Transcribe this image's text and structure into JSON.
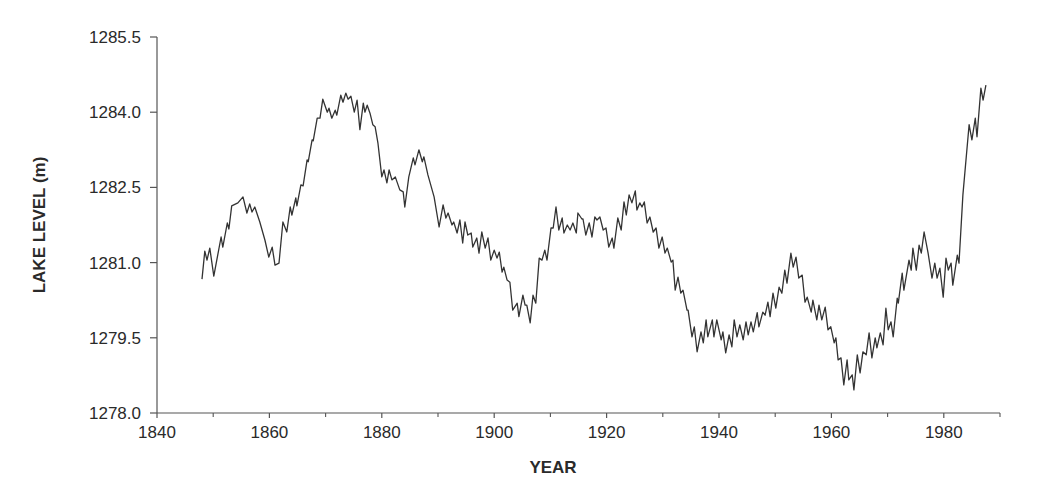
{
  "chart_data": {
    "type": "line",
    "title": "",
    "xlabel": "YEAR",
    "ylabel": "LAKE LEVEL (m)",
    "xlim": [
      1840,
      1990
    ],
    "ylim": [
      1278.0,
      1285.5
    ],
    "x_ticks": [
      1840,
      1860,
      1880,
      1900,
      1920,
      1940,
      1960,
      1980
    ],
    "x_tick_labels": [
      "1840",
      "1860",
      "1880",
      "1900",
      "1920",
      "1940",
      "1960",
      "1980"
    ],
    "x_minor_ticks": [
      1850,
      1870,
      1890,
      1910,
      1930,
      1950,
      1970,
      1990
    ],
    "y_ticks": [
      1278.0,
      1279.5,
      1281.0,
      1282.5,
      1284.0,
      1285.5
    ],
    "y_tick_labels": [
      "1278.0",
      "1279.5",
      "1281.0",
      "1282.5",
      "1284.0",
      "1285.5"
    ],
    "grid": false,
    "legend": null,
    "line_color": "#333333",
    "series": [
      {
        "name": "Lake level",
        "points": [
          [
            1848.0,
            1280.67
          ],
          [
            1848.5,
            1281.23
          ],
          [
            1848.9,
            1281.05
          ],
          [
            1849.4,
            1281.29
          ],
          [
            1850.1,
            1280.73
          ],
          [
            1851.4,
            1281.51
          ],
          [
            1851.7,
            1281.31
          ],
          [
            1852.5,
            1281.79
          ],
          [
            1852.8,
            1281.67
          ],
          [
            1853.3,
            1282.13
          ],
          [
            1854.4,
            1282.19
          ],
          [
            1855.3,
            1282.31
          ],
          [
            1856.0,
            1281.99
          ],
          [
            1856.5,
            1282.17
          ],
          [
            1856.9,
            1282.01
          ],
          [
            1857.4,
            1282.11
          ],
          [
            1858.3,
            1281.81
          ],
          [
            1859.2,
            1281.45
          ],
          [
            1859.9,
            1281.11
          ],
          [
            1860.5,
            1281.31
          ],
          [
            1861.0,
            1280.95
          ],
          [
            1861.7,
            1280.99
          ],
          [
            1862.4,
            1281.81
          ],
          [
            1863.1,
            1281.61
          ],
          [
            1863.7,
            1282.11
          ],
          [
            1864.0,
            1281.95
          ],
          [
            1864.7,
            1282.29
          ],
          [
            1864.9,
            1282.13
          ],
          [
            1865.6,
            1282.55
          ],
          [
            1866.0,
            1282.53
          ],
          [
            1866.7,
            1283.05
          ],
          [
            1866.9,
            1283.01
          ],
          [
            1867.6,
            1283.45
          ],
          [
            1867.8,
            1283.43
          ],
          [
            1868.5,
            1283.88
          ],
          [
            1869.0,
            1283.88
          ],
          [
            1869.5,
            1284.26
          ],
          [
            1870.3,
            1284.0
          ],
          [
            1870.6,
            1284.08
          ],
          [
            1871.1,
            1283.88
          ],
          [
            1871.7,
            1284.04
          ],
          [
            1872.0,
            1283.94
          ],
          [
            1872.7,
            1284.34
          ],
          [
            1873.1,
            1284.2
          ],
          [
            1873.6,
            1284.38
          ],
          [
            1874.0,
            1284.26
          ],
          [
            1874.5,
            1284.32
          ],
          [
            1875.1,
            1284.0
          ],
          [
            1875.6,
            1284.24
          ],
          [
            1876.1,
            1283.65
          ],
          [
            1876.7,
            1284.18
          ],
          [
            1877.0,
            1284.0
          ],
          [
            1877.4,
            1284.14
          ],
          [
            1877.9,
            1283.98
          ],
          [
            1878.4,
            1283.75
          ],
          [
            1878.8,
            1283.71
          ],
          [
            1879.3,
            1283.39
          ],
          [
            1880.0,
            1282.71
          ],
          [
            1880.4,
            1282.85
          ],
          [
            1880.9,
            1282.59
          ],
          [
            1881.3,
            1282.85
          ],
          [
            1881.8,
            1282.65
          ],
          [
            1882.4,
            1282.71
          ],
          [
            1882.7,
            1282.61
          ],
          [
            1883.2,
            1282.45
          ],
          [
            1883.8,
            1282.41
          ],
          [
            1884.1,
            1282.11
          ],
          [
            1884.8,
            1282.71
          ],
          [
            1885.6,
            1283.09
          ],
          [
            1885.9,
            1282.95
          ],
          [
            1886.6,
            1283.25
          ],
          [
            1887.2,
            1283.01
          ],
          [
            1887.5,
            1283.11
          ],
          [
            1888.2,
            1282.75
          ],
          [
            1889.3,
            1282.31
          ],
          [
            1890.2,
            1281.71
          ],
          [
            1890.9,
            1282.15
          ],
          [
            1891.4,
            1281.89
          ],
          [
            1891.8,
            1281.99
          ],
          [
            1892.5,
            1281.75
          ],
          [
            1892.8,
            1281.81
          ],
          [
            1893.4,
            1281.59
          ],
          [
            1893.9,
            1281.85
          ],
          [
            1894.4,
            1281.39
          ],
          [
            1894.8,
            1281.81
          ],
          [
            1895.3,
            1281.55
          ],
          [
            1895.9,
            1281.59
          ],
          [
            1896.2,
            1281.31
          ],
          [
            1896.9,
            1281.49
          ],
          [
            1897.3,
            1281.19
          ],
          [
            1897.8,
            1281.61
          ],
          [
            1898.4,
            1281.29
          ],
          [
            1898.9,
            1281.49
          ],
          [
            1899.4,
            1281.05
          ],
          [
            1900.0,
            1281.25
          ],
          [
            1900.5,
            1281.09
          ],
          [
            1900.9,
            1281.21
          ],
          [
            1901.4,
            1280.81
          ],
          [
            1901.7,
            1280.91
          ],
          [
            1902.3,
            1280.65
          ],
          [
            1902.8,
            1280.61
          ],
          [
            1903.3,
            1280.05
          ],
          [
            1904.1,
            1280.19
          ],
          [
            1904.4,
            1279.92
          ],
          [
            1905.1,
            1280.35
          ],
          [
            1905.5,
            1280.15
          ],
          [
            1905.8,
            1280.15
          ],
          [
            1906.4,
            1279.8
          ],
          [
            1906.9,
            1280.35
          ],
          [
            1907.4,
            1280.19
          ],
          [
            1908.0,
            1281.09
          ],
          [
            1908.5,
            1281.05
          ],
          [
            1909.0,
            1281.25
          ],
          [
            1909.4,
            1281.05
          ],
          [
            1910.1,
            1281.69
          ],
          [
            1910.5,
            1281.69
          ],
          [
            1911.0,
            1282.11
          ],
          [
            1911.5,
            1281.65
          ],
          [
            1912.1,
            1281.89
          ],
          [
            1912.4,
            1281.59
          ],
          [
            1913.0,
            1281.75
          ],
          [
            1913.5,
            1281.65
          ],
          [
            1914.0,
            1281.79
          ],
          [
            1914.6,
            1281.59
          ],
          [
            1914.9,
            1281.99
          ],
          [
            1915.6,
            1281.87
          ],
          [
            1915.8,
            1281.87
          ],
          [
            1916.3,
            1281.55
          ],
          [
            1916.9,
            1281.79
          ],
          [
            1917.4,
            1281.51
          ],
          [
            1917.9,
            1281.91
          ],
          [
            1918.3,
            1281.85
          ],
          [
            1918.8,
            1281.91
          ],
          [
            1919.4,
            1281.65
          ],
          [
            1919.9,
            1281.69
          ],
          [
            1920.4,
            1281.31
          ],
          [
            1921.0,
            1281.49
          ],
          [
            1921.3,
            1281.29
          ],
          [
            1922.0,
            1281.89
          ],
          [
            1922.6,
            1281.65
          ],
          [
            1923.1,
            1282.21
          ],
          [
            1923.5,
            1281.95
          ],
          [
            1924.0,
            1282.35
          ],
          [
            1924.5,
            1282.19
          ],
          [
            1925.1,
            1282.43
          ],
          [
            1925.4,
            1282.05
          ],
          [
            1925.9,
            1282.19
          ],
          [
            1926.3,
            1282.11
          ],
          [
            1926.7,
            1282.21
          ],
          [
            1927.2,
            1281.79
          ],
          [
            1927.7,
            1281.91
          ],
          [
            1928.3,
            1281.61
          ],
          [
            1928.8,
            1281.69
          ],
          [
            1929.3,
            1281.29
          ],
          [
            1929.9,
            1281.51
          ],
          [
            1930.4,
            1281.19
          ],
          [
            1930.8,
            1281.29
          ],
          [
            1931.5,
            1281.01
          ],
          [
            1931.8,
            1281.05
          ],
          [
            1932.2,
            1280.45
          ],
          [
            1932.7,
            1280.71
          ],
          [
            1933.2,
            1280.39
          ],
          [
            1933.6,
            1280.45
          ],
          [
            1934.3,
            1280.05
          ],
          [
            1934.5,
            1280.05
          ],
          [
            1935.2,
            1279.52
          ],
          [
            1935.6,
            1279.72
          ],
          [
            1936.1,
            1279.22
          ],
          [
            1936.8,
            1279.62
          ],
          [
            1937.2,
            1279.4
          ],
          [
            1937.7,
            1279.86
          ],
          [
            1938.0,
            1279.52
          ],
          [
            1938.8,
            1279.86
          ],
          [
            1939.1,
            1279.52
          ],
          [
            1939.6,
            1279.86
          ],
          [
            1940.4,
            1279.46
          ],
          [
            1940.7,
            1279.62
          ],
          [
            1941.2,
            1279.2
          ],
          [
            1941.8,
            1279.56
          ],
          [
            1942.3,
            1279.32
          ],
          [
            1942.7,
            1279.86
          ],
          [
            1943.2,
            1279.52
          ],
          [
            1943.7,
            1279.76
          ],
          [
            1944.3,
            1279.46
          ],
          [
            1944.8,
            1279.82
          ],
          [
            1945.2,
            1279.56
          ],
          [
            1945.7,
            1279.82
          ],
          [
            1946.1,
            1279.62
          ],
          [
            1946.8,
            1280.0
          ],
          [
            1947.1,
            1279.72
          ],
          [
            1947.8,
            1280.01
          ],
          [
            1948.2,
            1279.95
          ],
          [
            1948.7,
            1280.21
          ],
          [
            1949.1,
            1279.92
          ],
          [
            1949.6,
            1280.39
          ],
          [
            1950.1,
            1280.09
          ],
          [
            1950.7,
            1280.51
          ],
          [
            1951.2,
            1280.39
          ],
          [
            1951.7,
            1280.85
          ],
          [
            1952.1,
            1280.59
          ],
          [
            1952.8,
            1281.19
          ],
          [
            1953.2,
            1280.91
          ],
          [
            1953.7,
            1281.11
          ],
          [
            1954.2,
            1280.69
          ],
          [
            1954.8,
            1280.75
          ],
          [
            1955.3,
            1280.21
          ],
          [
            1955.7,
            1280.31
          ],
          [
            1956.4,
            1280.01
          ],
          [
            1956.7,
            1280.25
          ],
          [
            1957.4,
            1279.86
          ],
          [
            1957.8,
            1280.15
          ],
          [
            1958.3,
            1279.86
          ],
          [
            1958.9,
            1280.11
          ],
          [
            1959.4,
            1279.66
          ],
          [
            1959.9,
            1279.72
          ],
          [
            1960.5,
            1279.4
          ],
          [
            1960.8,
            1279.5
          ],
          [
            1961.2,
            1279.06
          ],
          [
            1961.7,
            1279.1
          ],
          [
            1962.2,
            1278.56
          ],
          [
            1962.8,
            1279.06
          ],
          [
            1963.1,
            1278.66
          ],
          [
            1963.7,
            1278.76
          ],
          [
            1964.0,
            1278.46
          ],
          [
            1964.6,
            1279.16
          ],
          [
            1965.1,
            1278.8
          ],
          [
            1965.6,
            1279.22
          ],
          [
            1966.2,
            1279.16
          ],
          [
            1966.7,
            1279.6
          ],
          [
            1967.2,
            1279.1
          ],
          [
            1967.8,
            1279.5
          ],
          [
            1968.1,
            1279.3
          ],
          [
            1968.7,
            1279.6
          ],
          [
            1969.2,
            1279.36
          ],
          [
            1969.7,
            1280.09
          ],
          [
            1970.1,
            1279.66
          ],
          [
            1970.6,
            1279.82
          ],
          [
            1971.0,
            1279.52
          ],
          [
            1971.7,
            1280.29
          ],
          [
            1971.9,
            1280.19
          ],
          [
            1972.6,
            1280.79
          ],
          [
            1972.9,
            1280.45
          ],
          [
            1973.5,
            1280.85
          ],
          [
            1973.8,
            1281.05
          ],
          [
            1974.2,
            1280.85
          ],
          [
            1974.5,
            1281.29
          ],
          [
            1975.1,
            1280.85
          ],
          [
            1975.6,
            1281.35
          ],
          [
            1976.0,
            1281.19
          ],
          [
            1976.5,
            1281.61
          ],
          [
            1977.2,
            1281.19
          ],
          [
            1977.9,
            1280.69
          ],
          [
            1978.4,
            1280.99
          ],
          [
            1978.8,
            1280.69
          ],
          [
            1979.3,
            1280.89
          ],
          [
            1979.9,
            1280.31
          ],
          [
            1980.4,
            1281.09
          ],
          [
            1980.8,
            1280.85
          ],
          [
            1981.3,
            1280.99
          ],
          [
            1981.6,
            1280.55
          ],
          [
            1982.4,
            1281.15
          ],
          [
            1982.7,
            1280.99
          ],
          [
            1983.4,
            1282.35
          ],
          [
            1984.5,
            1283.75
          ],
          [
            1985.0,
            1283.45
          ],
          [
            1985.6,
            1283.88
          ],
          [
            1985.9,
            1283.51
          ],
          [
            1986.6,
            1284.48
          ],
          [
            1987.0,
            1284.24
          ],
          [
            1987.5,
            1284.54
          ]
        ]
      }
    ]
  },
  "axis_color": "#555555"
}
